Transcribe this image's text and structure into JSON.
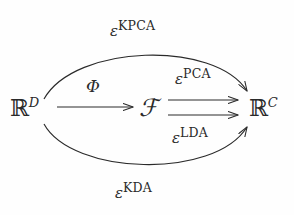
{
  "diagram": {
    "type": "commutative-diagram",
    "background_color": "#fefefe",
    "ink_color": "#2a2a2a",
    "nodes": [
      {
        "id": "domain",
        "base": "ℝ",
        "superscript": "D",
        "name": "R^D"
      },
      {
        "id": "feature",
        "base": "ℱ",
        "superscript": "",
        "name": "F"
      },
      {
        "id": "codomain",
        "base": "ℝ",
        "superscript": "C",
        "name": "R^C"
      }
    ],
    "edges": [
      {
        "id": "phi",
        "from": "domain",
        "to": "feature",
        "shape": "straight",
        "label_base": "Φ",
        "label_superscript": "",
        "label_position": "above"
      },
      {
        "id": "pca",
        "from": "feature",
        "to": "codomain",
        "shape": "straight",
        "label_base": "ε",
        "label_superscript": "PCA",
        "label_position": "above"
      },
      {
        "id": "lda",
        "from": "feature",
        "to": "codomain",
        "shape": "straight",
        "label_base": "ε",
        "label_superscript": "LDA",
        "label_position": "below"
      },
      {
        "id": "kpca",
        "from": "domain",
        "to": "codomain",
        "shape": "arc-above",
        "label_base": "ε",
        "label_superscript": "KPCA",
        "label_position": "above"
      },
      {
        "id": "kda",
        "from": "domain",
        "to": "codomain",
        "shape": "arc-below",
        "label_base": "ε",
        "label_superscript": "KDA",
        "label_position": "below"
      }
    ]
  }
}
